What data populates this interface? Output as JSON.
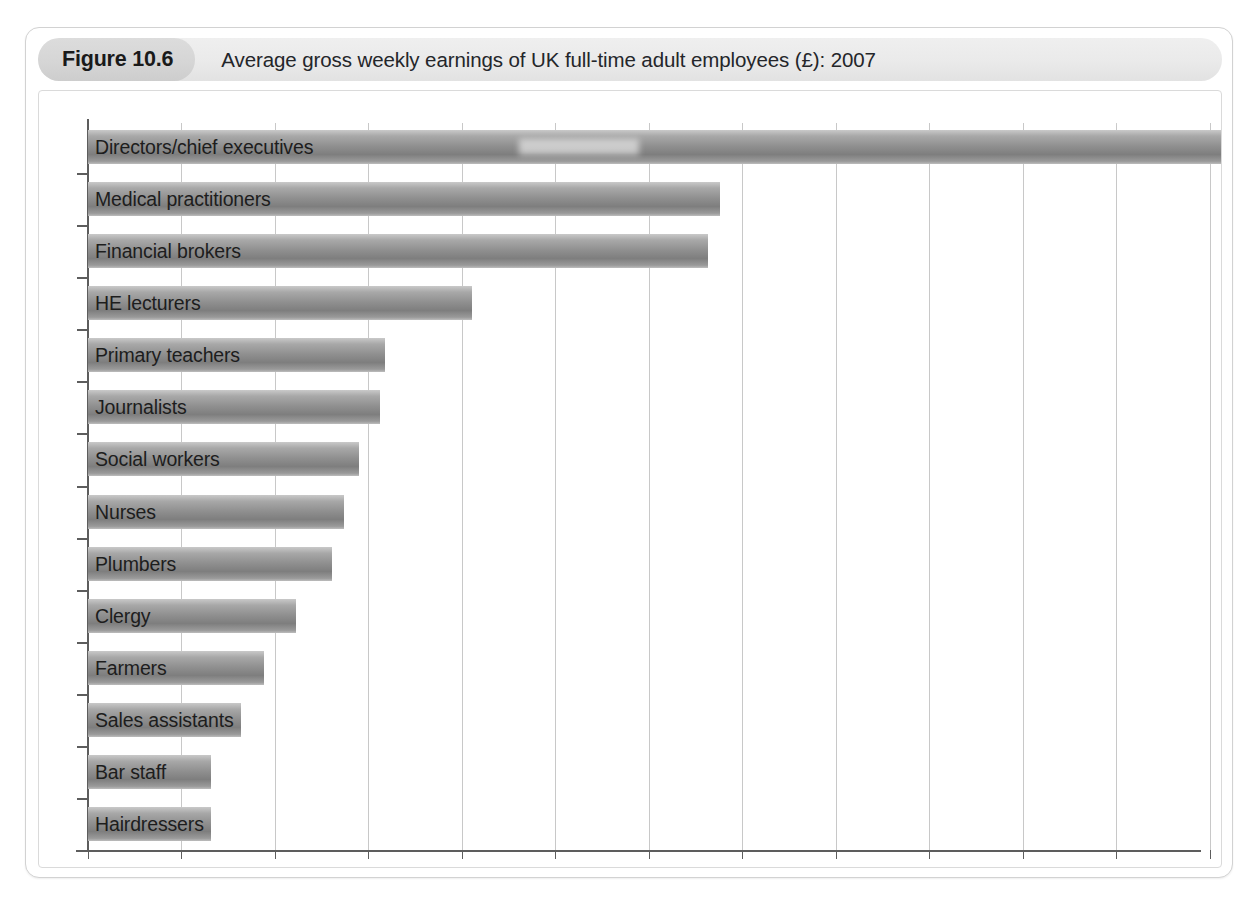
{
  "figure": {
    "badge": "Figure 10.6",
    "title": "Average gross weekly earnings of UK full-time adult employees (£): 2007"
  },
  "chart_data": {
    "type": "bar",
    "orientation": "horizontal",
    "title": "Average gross weekly earnings of UK full-time adult employees (£): 2007",
    "xlabel": "",
    "ylabel": "",
    "xlim": [
      0,
      2364
    ],
    "ylim": null,
    "grid": true,
    "legend": false,
    "xticks": [
      0,
      200,
      400,
      600,
      800,
      1000,
      1200,
      1400,
      1600,
      1800,
      2000,
      2200,
      2400
    ],
    "xtick_labels": [
      "0",
      "200",
      "400",
      "600",
      "800",
      "1000",
      "1200",
      "1400",
      "1600",
      "1800",
      "2000",
      "2200",
      "2400"
    ],
    "categories": [
      "Directors/chief executives",
      "Medical practitioners",
      "Financial brokers",
      "HE lecturers",
      "Primary teachers",
      "Journalists",
      "Social workers",
      "Nurses",
      "Plumbers",
      "Clergy",
      "Farmers",
      "Sales assistants",
      "Bar staff",
      "Hairdressers"
    ],
    "values": [
      2430,
      1352,
      1326,
      821,
      635,
      624,
      580,
      547,
      522,
      445,
      376,
      297,
      263,
      252
    ],
    "bar_color": "#8f8f8f",
    "grid_color": "#c8c8c8",
    "axis_color": "#5d5d5d"
  }
}
